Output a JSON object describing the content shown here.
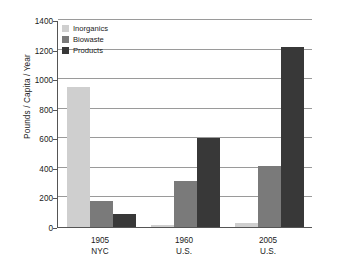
{
  "chart_data": {
    "type": "bar",
    "title": "",
    "xlabel": "",
    "ylabel": "Pounds / Capita / Year",
    "ylim": [
      0,
      1400
    ],
    "ytick_step": 200,
    "yticks": [
      0,
      200,
      400,
      600,
      800,
      1000,
      1200,
      1400
    ],
    "grid": true,
    "legend_position": "top-left",
    "categories": [
      "1905 NYC",
      "1960 U.S.",
      "2005 U.S."
    ],
    "category_lines": [
      {
        "line1": "1905",
        "line2": "NYC"
      },
      {
        "line1": "1960",
        "line2": "U.S."
      },
      {
        "line1": "2005",
        "line2": "U.S."
      }
    ],
    "series": [
      {
        "name": "Inorganics",
        "color": "#cfcfcf",
        "values": [
          950,
          15,
          30
        ]
      },
      {
        "name": "Biowaste",
        "color": "#7a7a7a",
        "values": [
          175,
          310,
          415
        ]
      },
      {
        "name": "Products",
        "color": "#383838",
        "values": [
          85,
          600,
          1220
        ]
      }
    ]
  },
  "axis": {
    "y_title": "Pounds / Capita / Year",
    "y_tick_labels": [
      "1400",
      "1200",
      "1000",
      "800",
      "600",
      "400",
      "200",
      "0"
    ]
  },
  "legend": {
    "items": [
      {
        "label": "Inorganics",
        "color": "#cfcfcf"
      },
      {
        "label": "Biowaste",
        "color": "#7a7a7a"
      },
      {
        "label": "Products",
        "color": "#383838"
      }
    ]
  }
}
